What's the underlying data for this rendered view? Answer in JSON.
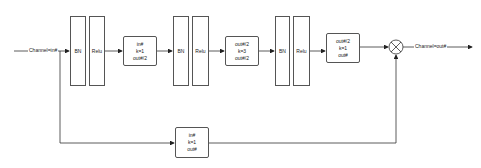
{
  "diagram": {
    "input_label": "Channel=in#",
    "output_label": "Channel=out#",
    "main_path": [
      {
        "type": "norm",
        "label": "BN"
      },
      {
        "type": "activation",
        "label": "Relu"
      },
      {
        "type": "conv",
        "lines": [
          "in#",
          "k=1",
          "out#/2"
        ]
      },
      {
        "type": "norm",
        "label": "BN"
      },
      {
        "type": "activation",
        "label": "Relu"
      },
      {
        "type": "conv",
        "lines": [
          "out#/2",
          "k=3",
          "out#/2"
        ]
      },
      {
        "type": "norm",
        "label": "BN"
      },
      {
        "type": "activation",
        "label": "Relu"
      },
      {
        "type": "conv",
        "lines": [
          "out#/2",
          "k=1",
          "out#"
        ]
      }
    ],
    "skip_path": {
      "type": "conv",
      "lines": [
        "in#",
        "k=1",
        "out#"
      ]
    },
    "merge_node": {
      "type": "elementwise-op",
      "symbol": "⊗"
    },
    "colors": {
      "line": "#333333",
      "box_border": "#555555",
      "background": "#ffffff"
    }
  }
}
